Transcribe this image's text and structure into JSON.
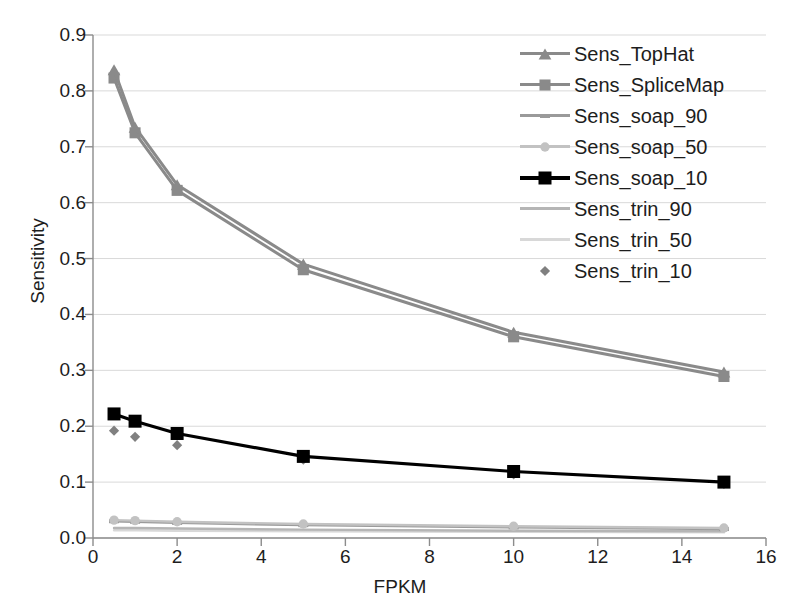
{
  "chart_data": {
    "type": "line",
    "title": "",
    "xlabel": "FPKM",
    "ylabel": "Sensitivity",
    "xlim": [
      0,
      16
    ],
    "ylim": [
      0.0,
      0.9
    ],
    "xticks": [
      "0",
      "2",
      "4",
      "6",
      "8",
      "10",
      "12",
      "14",
      "16"
    ],
    "yticks": [
      "0.0",
      "0.1",
      "0.2",
      "0.3",
      "0.4",
      "0.5",
      "0.6",
      "0.7",
      "0.8",
      "0.9"
    ],
    "grid": true,
    "legend_position": "upper right",
    "x": [
      0.5,
      1,
      2,
      5,
      10,
      15
    ],
    "series": [
      {
        "name": "Sens_TopHat",
        "marker": "triangle",
        "color": "#8a8a8a",
        "values": [
          0.838,
          0.735,
          0.632,
          0.49,
          0.368,
          0.297
        ]
      },
      {
        "name": "Sens_SpliceMap",
        "marker": "square",
        "color": "#8a8a8a",
        "values": [
          0.823,
          0.725,
          0.622,
          0.48,
          0.36,
          0.289
        ]
      },
      {
        "name": "Sens_soap_90",
        "marker": "dash",
        "color": "#9a9a9a",
        "values": [
          0.03,
          0.029,
          0.027,
          0.023,
          0.019,
          0.016
        ]
      },
      {
        "name": "Sens_soap_50",
        "marker": "circle",
        "color": "#c2c2c2",
        "values": [
          0.032,
          0.031,
          0.029,
          0.025,
          0.021,
          0.018
        ]
      },
      {
        "name": "Sens_soap_10",
        "marker": "square",
        "color": "#000000",
        "values": [
          0.222,
          0.209,
          0.187,
          0.146,
          0.119,
          0.1
        ]
      },
      {
        "name": "Sens_trin_90",
        "marker": "none",
        "color": "#b5b5b5",
        "values": [
          0.018,
          0.018,
          0.017,
          0.015,
          0.013,
          0.012
        ]
      },
      {
        "name": "Sens_trin_50",
        "marker": "none",
        "color": "#d8d8d8",
        "values": [
          0.014,
          0.014,
          0.013,
          0.012,
          0.011,
          0.01
        ]
      },
      {
        "name": "Sens_trin_10",
        "marker": "diamond",
        "color": "#808080",
        "values": [
          0.192,
          0.181,
          0.166,
          0.14,
          0.114,
          0.097
        ]
      }
    ]
  },
  "legend": {
    "items": [
      {
        "label": "Sens_TopHat"
      },
      {
        "label": "Sens_SpliceMap"
      },
      {
        "label": "Sens_soap_90"
      },
      {
        "label": "Sens_soap_50"
      },
      {
        "label": "Sens_soap_10"
      },
      {
        "label": "Sens_trin_90"
      },
      {
        "label": "Sens_trin_50"
      },
      {
        "label": "Sens_trin_10"
      }
    ]
  }
}
